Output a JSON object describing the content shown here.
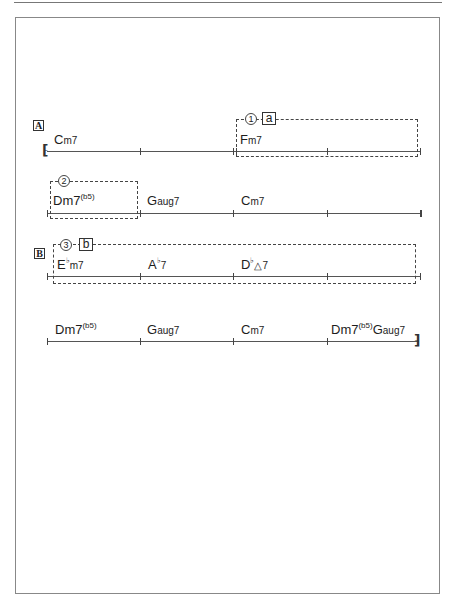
{
  "sheet": {
    "sections": [
      {
        "label": "A"
      },
      {
        "label": "B"
      }
    ],
    "lines": [
      {
        "bars": [
          {
            "chord": "Cm7",
            "root": "C",
            "quality": "m7"
          },
          {
            "chord": "",
            "root": "",
            "quality": ""
          },
          {
            "chord": "Fm7",
            "root": "F",
            "quality": "m7"
          },
          {
            "chord": "",
            "root": "",
            "quality": ""
          }
        ],
        "start_barline": "repeat-start",
        "end_barline": "single"
      },
      {
        "bars": [
          {
            "chord": "Dm7(b5)",
            "root": "D",
            "quality": "m7",
            "ext": "(b5)"
          },
          {
            "chord": "Gaug7",
            "root": "G",
            "quality": "aug7"
          },
          {
            "chord": "Cm7",
            "root": "C",
            "quality": "m7"
          },
          {
            "chord": "",
            "root": "",
            "quality": ""
          }
        ],
        "end_barline": "single"
      },
      {
        "bars": [
          {
            "chord": "Ebm7",
            "root": "E",
            "acc": "♭",
            "quality": "m7"
          },
          {
            "chord": "Ab7",
            "root": "A",
            "acc": "♭",
            "quality": "7"
          },
          {
            "chord": "Db△7",
            "root": "D",
            "acc": "♭",
            "quality": "△7"
          },
          {
            "chord": "",
            "root": "",
            "quality": ""
          }
        ],
        "end_barline": "single"
      },
      {
        "bars": [
          {
            "chord": "Dm7(b5)",
            "root": "D",
            "quality": "m7",
            "ext": "(b5)"
          },
          {
            "chord": "Gaug7",
            "root": "G",
            "quality": "aug7"
          },
          {
            "chord": "Cm7",
            "root": "C",
            "quality": "m7"
          },
          {
            "chord": "Dm7(b5) Gaug7",
            "root": "D",
            "quality": "m7",
            "ext": "(b5)",
            "root2": "G",
            "quality2": "aug7"
          }
        ],
        "end_barline": "repeat-end"
      }
    ],
    "annotations": [
      {
        "number": "1",
        "letter": "a"
      },
      {
        "number": "2",
        "letter": ""
      },
      {
        "number": "3",
        "letter": "b"
      }
    ],
    "glyphs": {
      "numbers": [
        "①",
        "②",
        "③"
      ],
      "flat": "♭",
      "repeat_start": "⁅",
      "repeat_end": "⁆"
    }
  }
}
